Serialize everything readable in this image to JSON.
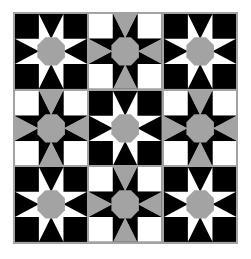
{
  "quilt": {
    "rows": 3,
    "cols": 3,
    "layout": [
      [
        "A",
        "B",
        "A"
      ],
      [
        "B",
        "A",
        "B"
      ],
      [
        "A",
        "B",
        "A"
      ]
    ],
    "colors": {
      "black": "#000000",
      "white": "#ffffff",
      "gray": "#a3a3a3",
      "border": "#a3a3a3"
    },
    "block_types": {
      "A": {
        "description": "white eight-point star on black with gray octagon center",
        "background": "#000000",
        "star": "#ffffff",
        "edge_triangles": "#000000",
        "corners": "#000000",
        "center": "#a3a3a3"
      },
      "B": {
        "description": "black eight-point star on white with gray edge triangles and gray octagon center",
        "background": "#000000",
        "star": "#000000",
        "edge_triangles": "#a3a3a3",
        "corners": "#ffffff",
        "center": "#a3a3a3"
      }
    }
  }
}
